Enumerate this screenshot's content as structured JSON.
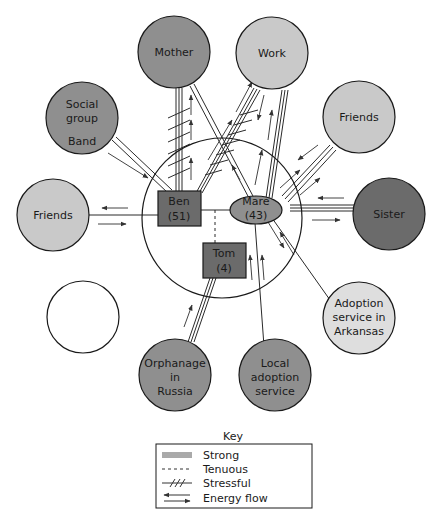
{
  "colors": {
    "dark": "#6b6b6b",
    "medium": "#8f8f8f",
    "light": "#c9c9c9",
    "verylight": "#dedede",
    "line": "#2a2a2a",
    "white": "#ffffff"
  },
  "family": {
    "ben": {
      "name": "Ben",
      "age": "(51)"
    },
    "mare": {
      "name": "Mare",
      "age": "(43)"
    },
    "tom": {
      "name": "Tom",
      "age": "(4)"
    }
  },
  "nodes": {
    "mother": {
      "label": "Mother"
    },
    "work": {
      "label": "Work"
    },
    "social_group": {
      "line1": "Social",
      "line2": "group",
      "line3": "Band"
    },
    "friends_right": {
      "label": "Friends"
    },
    "friends_left": {
      "label": "Friends"
    },
    "sister": {
      "label": "Sister"
    },
    "adoption_arkansas": {
      "line1": "Adoption",
      "line2": "service in",
      "line3": "Arkansas"
    },
    "local_adoption": {
      "line1": "Local",
      "line2": "adoption",
      "line3": "service"
    },
    "orphanage": {
      "line1": "Orphanage",
      "line2": "in",
      "line3": "Russia"
    },
    "empty": {
      "label": ""
    }
  },
  "key": {
    "title": "Key",
    "items": [
      {
        "label": "Strong"
      },
      {
        "label": "Tenuous"
      },
      {
        "label": "Stressful"
      },
      {
        "label": "Energy flow"
      }
    ]
  }
}
